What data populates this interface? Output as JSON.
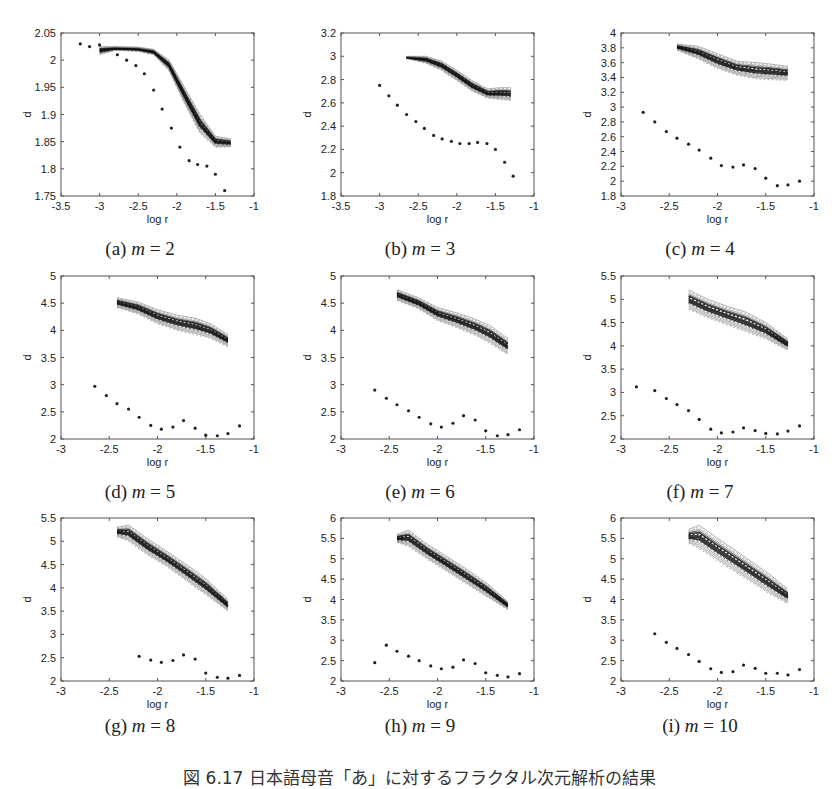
{
  "caption": "図 6.17  日本語母音「あ」に対するフラクタル次元解析の結果",
  "chart_data": [
    {
      "id": "a",
      "label": "(a)",
      "m": "2",
      "type": "scatter",
      "xlabel": "log r",
      "ylabel": "d",
      "xlim": [
        -3.5,
        -1
      ],
      "ylim": [
        1.75,
        2.05
      ],
      "xticks": [
        -3.5,
        -3,
        -2.5,
        -2,
        -1.5,
        -1
      ],
      "yticks": [
        1.75,
        1.8,
        1.85,
        1.9,
        1.95,
        2,
        2.05
      ],
      "ytick_labels": [
        "1.75",
        "1.8",
        "1.85",
        "1.9",
        "1.95",
        "2",
        "2.05"
      ],
      "band": {
        "x": [
          -3.0,
          -2.8,
          -2.5,
          -2.3,
          -2.1,
          -1.9,
          -1.7,
          -1.5,
          -1.3
        ],
        "upper": [
          2.025,
          2.025,
          2.024,
          2.02,
          2.0,
          1.95,
          1.9,
          1.86,
          1.855
        ],
        "lower": [
          2.01,
          2.018,
          2.016,
          2.01,
          1.98,
          1.92,
          1.865,
          1.84,
          1.84
        ]
      },
      "points": {
        "x": [
          -3.25,
          -3.13,
          -3.0,
          -2.77,
          -2.65,
          -2.53,
          -2.42,
          -2.3,
          -2.19,
          -2.07,
          -1.96,
          -1.84,
          -1.73,
          -1.61,
          -1.5,
          -1.38
        ],
        "y": [
          2.03,
          2.025,
          2.028,
          2.01,
          2.0,
          1.99,
          1.975,
          1.945,
          1.91,
          1.875,
          1.84,
          1.815,
          1.808,
          1.805,
          1.79,
          1.76
        ]
      }
    },
    {
      "id": "b",
      "label": "(b)",
      "m": "3",
      "type": "scatter",
      "xlabel": "log r",
      "ylabel": "d",
      "xlim": [
        -3.5,
        -1
      ],
      "ylim": [
        1.8,
        3.2
      ],
      "xticks": [
        -3.5,
        -3,
        -2.5,
        -2,
        -1.5,
        -1
      ],
      "yticks": [
        1.8,
        2,
        2.2,
        2.4,
        2.6,
        2.8,
        3,
        3.2
      ],
      "ytick_labels": [
        "1.8",
        "2",
        "2.2",
        "2.4",
        "2.6",
        "2.8",
        "3",
        "3.2"
      ],
      "band": {
        "x": [
          -2.65,
          -2.4,
          -2.2,
          -2.0,
          -1.8,
          -1.6,
          -1.45,
          -1.3
        ],
        "upper": [
          3.0,
          3.0,
          2.96,
          2.88,
          2.79,
          2.72,
          2.73,
          2.73
        ],
        "lower": [
          2.98,
          2.94,
          2.88,
          2.79,
          2.7,
          2.64,
          2.63,
          2.62
        ]
      },
      "points": {
        "x": [
          -3.0,
          -2.88,
          -2.77,
          -2.65,
          -2.53,
          -2.42,
          -2.3,
          -2.19,
          -2.07,
          -1.96,
          -1.84,
          -1.73,
          -1.61,
          -1.5,
          -1.38,
          -1.27
        ],
        "y": [
          2.75,
          2.66,
          2.58,
          2.5,
          2.44,
          2.38,
          2.32,
          2.29,
          2.27,
          2.25,
          2.25,
          2.26,
          2.25,
          2.2,
          2.09,
          1.97
        ]
      }
    },
    {
      "id": "c",
      "label": "(c)",
      "m": "4",
      "type": "scatter",
      "xlabel": "log r",
      "ylabel": "d",
      "xlim": [
        -3,
        -1
      ],
      "ylim": [
        1.8,
        4
      ],
      "xticks": [
        -3,
        -2.5,
        -2,
        -1.5,
        -1
      ],
      "yticks": [
        1.8,
        2,
        2.2,
        2.4,
        2.6,
        2.8,
        3,
        3.2,
        3.4,
        3.6,
        3.8,
        4
      ],
      "ytick_labels": [
        "1.8",
        "2",
        "2.2",
        "2.4",
        "2.6",
        "2.8",
        "3",
        "3.2",
        "3.4",
        "3.6",
        "3.8",
        "4"
      ],
      "band": {
        "x": [
          -2.42,
          -2.2,
          -2.0,
          -1.8,
          -1.6,
          -1.45,
          -1.27
        ],
        "upper": [
          3.85,
          3.82,
          3.72,
          3.62,
          3.6,
          3.58,
          3.55
        ],
        "lower": [
          3.77,
          3.65,
          3.52,
          3.43,
          3.38,
          3.37,
          3.36
        ]
      },
      "points": {
        "x": [
          -2.77,
          -2.65,
          -2.53,
          -2.42,
          -2.3,
          -2.19,
          -2.07,
          -1.96,
          -1.84,
          -1.73,
          -1.61,
          -1.5,
          -1.38,
          -1.27,
          -1.15
        ],
        "y": [
          2.93,
          2.8,
          2.67,
          2.58,
          2.5,
          2.42,
          2.31,
          2.21,
          2.19,
          2.22,
          2.17,
          2.04,
          1.94,
          1.95,
          2.0
        ]
      }
    },
    {
      "id": "d",
      "label": "(d)",
      "m": "5",
      "type": "scatter",
      "xlabel": "log r",
      "ylabel": "d",
      "xlim": [
        -3,
        -1
      ],
      "ylim": [
        2,
        5
      ],
      "xticks": [
        -3,
        -2.5,
        -2,
        -1.5,
        -1
      ],
      "yticks": [
        2,
        2.5,
        3,
        3.5,
        4,
        4.5,
        5
      ],
      "ytick_labels": [
        "2",
        "2.5",
        "3",
        "3.5",
        "4",
        "4.5",
        "5"
      ],
      "band": {
        "x": [
          -2.42,
          -2.2,
          -2.0,
          -1.8,
          -1.6,
          -1.45,
          -1.27
        ],
        "upper": [
          4.6,
          4.52,
          4.38,
          4.28,
          4.22,
          4.12,
          3.92
        ],
        "lower": [
          4.42,
          4.3,
          4.12,
          4.0,
          3.92,
          3.85,
          3.7
        ]
      },
      "points": {
        "x": [
          -2.65,
          -2.53,
          -2.42,
          -2.3,
          -2.19,
          -2.07,
          -1.96,
          -1.84,
          -1.73,
          -1.61,
          -1.5,
          -1.38,
          -1.27,
          -1.15
        ],
        "y": [
          2.97,
          2.8,
          2.65,
          2.55,
          2.4,
          2.25,
          2.18,
          2.22,
          2.34,
          2.2,
          2.07,
          2.06,
          2.1,
          2.24
        ]
      }
    },
    {
      "id": "e",
      "label": "(e)",
      "m": "6",
      "type": "scatter",
      "xlabel": "log r",
      "ylabel": "d",
      "xlim": [
        -3,
        -1
      ],
      "ylim": [
        2,
        5
      ],
      "xticks": [
        -3,
        -2.5,
        -2,
        -1.5,
        -1
      ],
      "yticks": [
        2,
        2.5,
        3,
        3.5,
        4,
        4.5,
        5
      ],
      "ytick_labels": [
        "2",
        "2.5",
        "3",
        "3.5",
        "4",
        "4.5",
        "5"
      ],
      "band": {
        "x": [
          -2.42,
          -2.2,
          -2.0,
          -1.8,
          -1.6,
          -1.45,
          -1.27
        ],
        "upper": [
          4.75,
          4.6,
          4.42,
          4.32,
          4.2,
          4.08,
          3.85
        ],
        "lower": [
          4.55,
          4.4,
          4.18,
          4.05,
          3.9,
          3.75,
          3.55
        ]
      },
      "points": {
        "x": [
          -2.65,
          -2.53,
          -2.42,
          -2.3,
          -2.19,
          -2.07,
          -1.96,
          -1.84,
          -1.73,
          -1.61,
          -1.5,
          -1.38,
          -1.27,
          -1.15
        ],
        "y": [
          2.9,
          2.75,
          2.63,
          2.52,
          2.4,
          2.28,
          2.22,
          2.29,
          2.43,
          2.35,
          2.15,
          2.06,
          2.08,
          2.17
        ]
      }
    },
    {
      "id": "f",
      "label": "(f)",
      "m": "7",
      "type": "scatter",
      "xlabel": "log r",
      "ylabel": "d",
      "xlim": [
        -3,
        -1
      ],
      "ylim": [
        2,
        5.5
      ],
      "xticks": [
        -3,
        -2.5,
        -2,
        -1.5,
        -1
      ],
      "yticks": [
        2,
        2.5,
        3,
        3.5,
        4,
        4.5,
        5,
        5.5
      ],
      "ytick_labels": [
        "2",
        "2.5",
        "3",
        "3.5",
        "4",
        "4.5",
        "5",
        "5.5"
      ],
      "band": {
        "x": [
          -2.3,
          -2.1,
          -1.9,
          -1.7,
          -1.5,
          -1.27
        ],
        "upper": [
          5.2,
          5.0,
          4.85,
          4.72,
          4.5,
          4.15
        ],
        "lower": [
          4.78,
          4.6,
          4.45,
          4.3,
          4.15,
          3.9
        ]
      },
      "points": {
        "x": [
          -2.84,
          -2.65,
          -2.53,
          -2.42,
          -2.3,
          -2.19,
          -2.07,
          -1.96,
          -1.84,
          -1.73,
          -1.61,
          -1.5,
          -1.38,
          -1.27,
          -1.15
        ],
        "y": [
          3.12,
          3.04,
          2.87,
          2.74,
          2.61,
          2.42,
          2.21,
          2.13,
          2.15,
          2.24,
          2.18,
          2.12,
          2.11,
          2.17,
          2.28
        ]
      }
    },
    {
      "id": "g",
      "label": "(g)",
      "m": "8",
      "type": "scatter",
      "xlabel": "log r",
      "ylabel": "d",
      "xlim": [
        -3,
        -1
      ],
      "ylim": [
        2,
        5.5
      ],
      "xticks": [
        -3,
        -2.5,
        -2,
        -1.5,
        -1
      ],
      "yticks": [
        2,
        2.5,
        3,
        3.5,
        4,
        4.5,
        5,
        5.5
      ],
      "ytick_labels": [
        "2",
        "2.5",
        "3",
        "3.5",
        "4",
        "4.5",
        "5",
        "5.5"
      ],
      "band": {
        "x": [
          -2.42,
          -2.3,
          -2.1,
          -1.9,
          -1.7,
          -1.5,
          -1.27
        ],
        "upper": [
          5.3,
          5.35,
          5.05,
          4.78,
          4.5,
          4.2,
          3.75
        ],
        "lower": [
          5.1,
          5.0,
          4.7,
          4.45,
          4.15,
          3.85,
          3.5
        ]
      },
      "points": {
        "x": [
          -2.19,
          -2.07,
          -1.96,
          -1.84,
          -1.73,
          -1.61,
          -1.5,
          -1.38,
          -1.27,
          -1.15
        ],
        "y": [
          2.53,
          2.45,
          2.4,
          2.44,
          2.56,
          2.47,
          2.17,
          2.08,
          2.06,
          2.12
        ]
      }
    },
    {
      "id": "h",
      "label": "(h)",
      "m": "9",
      "type": "scatter",
      "xlabel": "log r",
      "ylabel": "d",
      "xlim": [
        -3,
        -1
      ],
      "ylim": [
        2,
        6
      ],
      "xticks": [
        -3,
        -2.5,
        -2,
        -1.5,
        -1
      ],
      "yticks": [
        2,
        2.5,
        3,
        3.5,
        4,
        4.5,
        5,
        5.5,
        6
      ],
      "ytick_labels": [
        "2",
        "2.5",
        "3",
        "3.5",
        "4",
        "4.5",
        "5",
        "5.5",
        "6"
      ],
      "band": {
        "x": [
          -2.42,
          -2.3,
          -2.1,
          -1.9,
          -1.7,
          -1.5,
          -1.27
        ],
        "upper": [
          5.6,
          5.7,
          5.35,
          5.05,
          4.75,
          4.42,
          3.95
        ],
        "lower": [
          5.4,
          5.3,
          4.98,
          4.68,
          4.38,
          4.08,
          3.75
        ]
      },
      "points": {
        "x": [
          -2.65,
          -2.53,
          -2.42,
          -2.3,
          -2.19,
          -2.07,
          -1.96,
          -1.84,
          -1.73,
          -1.61,
          -1.5,
          -1.38,
          -1.27,
          -1.15
        ],
        "y": [
          2.45,
          2.88,
          2.73,
          2.61,
          2.5,
          2.37,
          2.3,
          2.34,
          2.52,
          2.43,
          2.2,
          2.14,
          2.1,
          2.18
        ]
      }
    },
    {
      "id": "i",
      "label": "(i)",
      "m": "10",
      "type": "scatter",
      "xlabel": "log r",
      "ylabel": "d",
      "xlim": [
        -3,
        -1
      ],
      "ylim": [
        2,
        6
      ],
      "xticks": [
        -3,
        -2.5,
        -2,
        -1.5,
        -1
      ],
      "yticks": [
        2,
        2.5,
        3,
        3.5,
        4,
        4.5,
        5,
        5.5,
        6
      ],
      "ytick_labels": [
        "2",
        "2.5",
        "3",
        "3.5",
        "4",
        "4.5",
        "5",
        "5.5",
        "6"
      ],
      "band": {
        "x": [
          -2.3,
          -2.19,
          -2.0,
          -1.8,
          -1.6,
          -1.45,
          -1.27
        ],
        "upper": [
          5.72,
          5.82,
          5.5,
          5.18,
          4.85,
          4.6,
          4.25
        ],
        "lower": [
          5.38,
          5.25,
          4.95,
          4.65,
          4.35,
          4.12,
          3.9
        ]
      },
      "points": {
        "x": [
          -2.65,
          -2.53,
          -2.42,
          -2.3,
          -2.19,
          -2.07,
          -1.96,
          -1.84,
          -1.73,
          -1.61,
          -1.5,
          -1.38,
          -1.27,
          -1.15
        ],
        "y": [
          3.16,
          2.95,
          2.8,
          2.65,
          2.48,
          2.3,
          2.21,
          2.23,
          2.39,
          2.31,
          2.19,
          2.19,
          2.15,
          2.28
        ]
      }
    }
  ]
}
